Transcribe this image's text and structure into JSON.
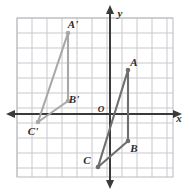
{
  "figure": {
    "background_color": "#ffffff"
  },
  "chart_data": {
    "type": "scatter",
    "title": "",
    "xlabel": "x",
    "ylabel": "y",
    "grid": true,
    "legend": false,
    "xlim": [
      -6.2,
      4.2
    ],
    "ylim": [
      -6.4,
      6.4
    ],
    "axis_origin_label": "O",
    "grid_step": 1,
    "pixel": {
      "origin_x": 110,
      "origin_y": 114,
      "unit": 15,
      "grid_left": 17,
      "grid_top": 18,
      "grid_right": 173,
      "grid_bottom": 177
    },
    "series": [
      {
        "name": "Triangle ABC",
        "color": "#6e6e6e",
        "closed": true,
        "points": [
          {
            "label": "A",
            "x": 1.2,
            "y": 2.9,
            "px": 128,
            "py": 70,
            "label_dx": 6,
            "label_dy": -4
          },
          {
            "label": "B",
            "x": 1.2,
            "y": -1.8,
            "px": 128,
            "py": 141,
            "label_dx": 6,
            "label_dy": 11
          },
          {
            "label": "C",
            "x": -0.8,
            "y": -3.5,
            "px": 98,
            "py": 167,
            "label_dx": -11,
            "label_dy": -3
          }
        ]
      },
      {
        "name": "Triangle A'B'C'",
        "color": "#a8a8a8",
        "closed": true,
        "points": [
          {
            "label": "A'",
            "x": -2.8,
            "y": 5.4,
            "px": 68,
            "py": 33,
            "label_dx": 5,
            "label_dy": -5
          },
          {
            "label": "B'",
            "x": -2.8,
            "y": 0.9,
            "px": 68,
            "py": 101,
            "label_dx": 6,
            "label_dy": 2
          },
          {
            "label": "C'",
            "x": -4.8,
            "y": -0.5,
            "px": 38,
            "py": 122,
            "label_dx": -5,
            "label_dy": 13
          }
        ]
      }
    ],
    "colors": {
      "grid_line": "#c9c9cf",
      "grid_border": "#b9b9c0",
      "axis": "#3a3a3a",
      "triangle_original": "#6e6e6e",
      "triangle_image": "#a8a8a8",
      "label_text": "#2b2b2b"
    }
  },
  "labels": {
    "x_axis": "x",
    "y_axis": "y",
    "origin": "O",
    "vertex_a": "A",
    "vertex_b": "B",
    "vertex_c": "C",
    "vertex_a_prime": "A'",
    "vertex_b_prime": "B'",
    "vertex_c_prime": "C'"
  }
}
